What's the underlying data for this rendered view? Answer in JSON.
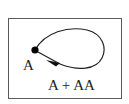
{
  "diagram": {
    "node": {
      "label": "A",
      "cx": 35,
      "cy": 50,
      "r": 3.5
    },
    "loop": {
      "label": "A + AA",
      "path": "M35,50 C45,32 70,27 88,31 C103,35 106,48 102,58 C97,70 80,72 62,65 L38,52",
      "arrow_direction": "toward node"
    },
    "colors": {
      "line": "#222222",
      "border": "#5a5a5a",
      "background": "#ffffff"
    }
  }
}
